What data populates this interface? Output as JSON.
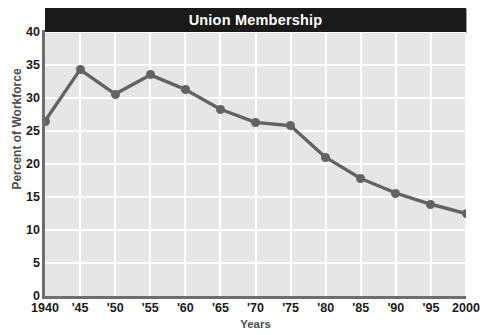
{
  "chart_data": {
    "type": "line",
    "title": "Union Membership",
    "xlabel": "Years",
    "ylabel": "Percent of Workforce",
    "categories": [
      "1940",
      "'45",
      "'50",
      "'55",
      "'60",
      "'65",
      "'70",
      "'75",
      "'80",
      "'85",
      "'90",
      "'95",
      "2000"
    ],
    "x": [
      1940,
      1945,
      1950,
      1955,
      1960,
      1965,
      1970,
      1975,
      1980,
      1985,
      1990,
      1995,
      2000
    ],
    "values": [
      26.5,
      34.3,
      30.6,
      33.5,
      31.3,
      28.3,
      26.3,
      25.8,
      21.0,
      17.8,
      15.6,
      13.9,
      12.5
    ],
    "series": [
      {
        "name": "Percent of Workforce",
        "values": [
          26.5,
          34.3,
          30.6,
          33.5,
          31.3,
          28.3,
          26.3,
          25.8,
          21.0,
          17.8,
          15.6,
          13.9,
          12.5
        ]
      }
    ],
    "ylim": [
      0,
      40
    ],
    "yticks": [
      0,
      5,
      10,
      15,
      20,
      25,
      30,
      35,
      40
    ],
    "ytick_labels": [
      "0",
      "5",
      "10",
      "15",
      "20",
      "25",
      "30",
      "35",
      "40"
    ],
    "xlim": [
      1940,
      2000
    ],
    "grid": true,
    "legend": false,
    "line_color": "#636363",
    "marker_color": "#636363",
    "plot_background": "#e6e6e6",
    "gridline_color": "#ffffff",
    "title_background": "#1a1a1a",
    "title_color": "#ffffff",
    "axis_color": "#6e6e6e"
  }
}
